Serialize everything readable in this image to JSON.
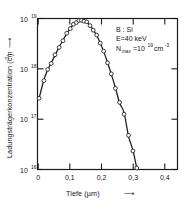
{
  "chart_data": {
    "type": "line",
    "title": "",
    "subtitle": "",
    "xlabel": "Tiefe (µm)",
    "ylabel": "Ladungsträgerkonzentration (cm",
    "ylabel_exponent": "-3",
    "ylabel_suffix": ")",
    "xlim": [
      0,
      0.44
    ],
    "ylim_log10": [
      16,
      19
    ],
    "yscale": "log",
    "xscale": "linear",
    "grid": false,
    "legend": false,
    "frame": true,
    "xticks": [
      "0",
      "0,1",
      "0,2",
      "0,3",
      "0,4"
    ],
    "xtick_values": [
      0,
      0.1,
      0.2,
      0.3,
      0.4
    ],
    "yticks": [
      "10",
      "10",
      "10",
      "10"
    ],
    "ytick_exponents": [
      "19",
      "18",
      "17",
      "16"
    ],
    "ytick_values": [
      1e+19,
      1e+18,
      1e+17,
      1e+16
    ],
    "series": [
      {
        "name": "measured carrier concentration",
        "marker": "open-circle",
        "line": "solid",
        "x": [
          0.005,
          0.02,
          0.032,
          0.043,
          0.055,
          0.068,
          0.08,
          0.092,
          0.103,
          0.113,
          0.122,
          0.13,
          0.138,
          0.146,
          0.155,
          0.165,
          0.175,
          0.186,
          0.197,
          0.208,
          0.22,
          0.232,
          0.245,
          0.258,
          0.272,
          0.286,
          0.3,
          0.312
        ],
        "y": [
          2.6e+17,
          6e+17,
          9.5e+17,
          1.3e+18,
          1.85e+18,
          2.7e+18,
          3.7e+18,
          5e+18,
          6.4e+18,
          7.6e+18,
          8.5e+18,
          9e+18,
          9.2e+18,
          9e+18,
          8.4e+18,
          7.3e+18,
          6e+18,
          4.6e+18,
          3.3e+18,
          2.2e+18,
          1.35e+18,
          7.8e+17,
          4.2e+17,
          2.1e+17,
          1.35e+17,
          4.6e+16,
          2.4e+16,
          1.05e+16
        ]
      }
    ],
    "curve": {
      "name": "fitted gaussian profile",
      "peak_x": 0.138,
      "peak_y": 9.3e+18
    },
    "annotations": [
      {
        "name": "material-system",
        "text": "B : Si"
      },
      {
        "name": "implant-energy",
        "text": "E=40 keV"
      },
      {
        "name": "peak-concentration",
        "text_prefix": "N",
        "text_sub": "max",
        "text_mid": "=10",
        "text_sup": "19",
        "text_unit": "cm",
        "text_unit_sup": "-3"
      }
    ],
    "xlabel_arrow": "⟶",
    "ylabel_arrow": "⟶"
  },
  "colors": {
    "axis": "#1a1a1a",
    "curve": "#1a1a1a",
    "marker_fill": "#ffffff",
    "marker_stroke": "#1a1a1a",
    "background": "#ffffff",
    "text": "#151515"
  }
}
